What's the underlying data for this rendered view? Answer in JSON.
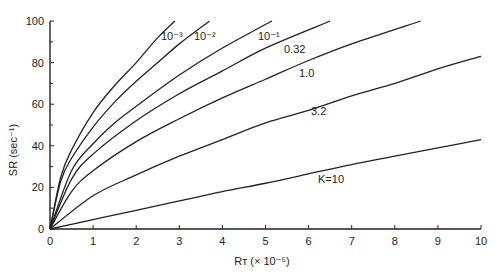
{
  "chart_data": {
    "type": "line",
    "title": "",
    "xlabel": "R_T (× 10^-5)",
    "ylabel": "SR (sec^-1)",
    "xlim": [
      0,
      10
    ],
    "ylim": [
      0,
      100
    ],
    "xticks": [
      "0",
      "1",
      "2",
      "3",
      "4",
      "5",
      "6",
      "7",
      "8",
      "9",
      "10"
    ],
    "yticks": [
      "0",
      "20",
      "40",
      "60",
      "80",
      "100"
    ],
    "grid": false,
    "legend": "inline curve labels",
    "series": [
      {
        "name": "10^-3",
        "label": "10⁻³",
        "x": [
          0,
          0.25,
          0.5,
          1,
          1.5,
          2,
          2.5,
          2.9
        ],
        "y": [
          0,
          25,
          38,
          56,
          69,
          80,
          92,
          100
        ]
      },
      {
        "name": "10^-2",
        "label": "10⁻²",
        "x": [
          0,
          0.25,
          0.5,
          1,
          1.5,
          2,
          2.5,
          3,
          3.7
        ],
        "y": [
          0,
          23,
          34,
          49,
          61,
          71,
          80,
          89,
          100
        ]
      },
      {
        "name": "10^-1",
        "label": "10⁻¹",
        "x": [
          0,
          0.5,
          1,
          1.5,
          2,
          3,
          4,
          5.15
        ],
        "y": [
          0,
          28,
          41,
          51,
          59,
          74,
          87,
          100
        ]
      },
      {
        "name": "0.32",
        "label": "0.32",
        "x": [
          0,
          0.5,
          1,
          2,
          3,
          4,
          5,
          6.5
        ],
        "y": [
          0,
          24,
          36,
          52,
          65,
          76,
          87,
          100
        ]
      },
      {
        "name": "1.0",
        "label": "1.0",
        "x": [
          0,
          0.5,
          1,
          2,
          3,
          4,
          5,
          6,
          7,
          8.6
        ],
        "y": [
          0,
          18,
          28,
          42,
          53,
          63,
          72,
          81,
          89,
          100
        ]
      },
      {
        "name": "3.2",
        "label": "3.2",
        "x": [
          0,
          1,
          2,
          3,
          4,
          5,
          6,
          7,
          8,
          9,
          10
        ],
        "y": [
          0,
          16,
          26,
          35,
          43,
          51,
          57,
          64,
          70,
          77,
          83
        ]
      },
      {
        "name": "K=10",
        "label": "K=10",
        "x": [
          0,
          1,
          2,
          3,
          4,
          5,
          6,
          7,
          8,
          9,
          10
        ],
        "y": [
          0,
          4.5,
          9,
          13.5,
          18,
          22,
          26.5,
          31,
          35,
          39,
          43
        ]
      }
    ]
  }
}
